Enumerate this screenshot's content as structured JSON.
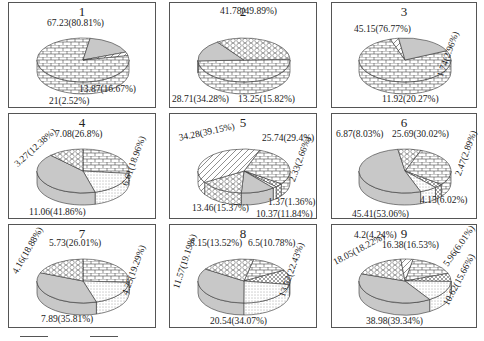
{
  "chart_data": [
    {
      "type": "pie",
      "title": "1",
      "slices": [
        {
          "value": 67.23,
          "percent": 80.81,
          "label": "67.23(80.81%)",
          "pattern": "brick"
        },
        {
          "value": 13.87,
          "percent": 16.67,
          "label": "13.87(16.67%)",
          "pattern": "gray"
        },
        {
          "value": 2.1,
          "percent": 2.52,
          "label": "21(2.52%)",
          "pattern": "diagonal"
        }
      ]
    },
    {
      "type": "pie",
      "title": "2",
      "slices": [
        {
          "value": 41.78,
          "percent": 49.89,
          "label": "41.78(49.89%)",
          "pattern": "brick"
        },
        {
          "value": 13.25,
          "percent": 15.82,
          "label": "13.25(15.82%)",
          "pattern": "gray"
        },
        {
          "value": 28.71,
          "percent": 34.28,
          "label": "28.71(34.28%)",
          "pattern": "hex"
        }
      ]
    },
    {
      "type": "pie",
      "title": "3",
      "slices": [
        {
          "value": 45.15,
          "percent": 76.77,
          "label": "45.15(76.77%)",
          "pattern": "brick"
        },
        {
          "value": 1.74,
          "percent": 2.96,
          "label": "1.74(2.96%)",
          "pattern": "diagonal"
        },
        {
          "value": 11.92,
          "percent": 20.27,
          "label": "11.92(20.27%)",
          "pattern": "gray"
        }
      ]
    },
    {
      "type": "pie",
      "title": "4",
      "slices": [
        {
          "value": 7.08,
          "percent": 26.8,
          "label": "7.08(26.8%)",
          "pattern": "brick"
        },
        {
          "value": 6.61,
          "percent": 18.96,
          "label": "6.61(18.96%)",
          "pattern": "dots"
        },
        {
          "value": 11.06,
          "percent": 41.86,
          "label": "11.06(41.86%)",
          "pattern": "gray"
        },
        {
          "value": 3.27,
          "percent": 12.38,
          "label": "3.27(12.38%)",
          "pattern": "hex"
        }
      ]
    },
    {
      "type": "pie",
      "title": "5",
      "slices": [
        {
          "value": 25.74,
          "percent": 29.4,
          "label": "25.74(29.4%)",
          "pattern": "brick"
        },
        {
          "value": 2.33,
          "percent": 2.66,
          "label": "2.33(2.66%)",
          "pattern": "crosshatch"
        },
        {
          "value": 1.37,
          "percent": 1.36,
          "label": "1.37(1.36%)",
          "pattern": "dots"
        },
        {
          "value": 10.37,
          "percent": 11.84,
          "label": "10.37(11.84%)",
          "pattern": "gray"
        },
        {
          "value": 13.46,
          "percent": 15.37,
          "label": "13.46(15.37%)",
          "pattern": "hex"
        },
        {
          "value": 34.28,
          "percent": 39.15,
          "label": "34.28(39.15%)",
          "pattern": "diagonal"
        }
      ]
    },
    {
      "type": "pie",
      "title": "6",
      "slices": [
        {
          "value": 25.69,
          "percent": 30.02,
          "label": "25.69(30.02%)",
          "pattern": "brick"
        },
        {
          "value": 2.47,
          "percent": 2.89,
          "label": "2.47(2.89%)",
          "pattern": "crosshatch"
        },
        {
          "value": 4.15,
          "percent": 6.02,
          "label": "4.15(6.02%)",
          "pattern": "dots"
        },
        {
          "value": 45.41,
          "percent": 53.06,
          "label": "45.41(53.06%)",
          "pattern": "gray"
        },
        {
          "value": 6.87,
          "percent": 8.03,
          "label": "6.87(8.03%)",
          "pattern": "hex"
        }
      ]
    },
    {
      "type": "pie",
      "title": "7",
      "slices": [
        {
          "value": 5.73,
          "percent": 26.01,
          "label": "5.73(26.01%)",
          "pattern": "brick"
        },
        {
          "value": 4.25,
          "percent": 19.29,
          "label": "4.25(19.29%)",
          "pattern": "dots"
        },
        {
          "value": 7.89,
          "percent": 35.81,
          "label": "7.89(35.81%)",
          "pattern": "gray"
        },
        {
          "value": 4.16,
          "percent": 18.88,
          "label": "4.16(18.88%)",
          "pattern": "hex"
        }
      ]
    },
    {
      "type": "pie",
      "title": "8",
      "slices": [
        {
          "value": 8.15,
          "percent": 13.52,
          "label": "8.15(13.52%)",
          "pattern": "brick"
        },
        {
          "value": 6.5,
          "percent": 10.78,
          "label": "6.5(10.78%)",
          "pattern": "crosshatch"
        },
        {
          "value": 13.52,
          "percent": 22.43,
          "label": "13.52(22.43%)",
          "pattern": "dots"
        },
        {
          "value": 20.54,
          "percent": 34.07,
          "label": "20.54(34.07%)",
          "pattern": "gray"
        },
        {
          "value": 11.57,
          "percent": 19.19,
          "label": "11.57(19.19%)",
          "pattern": "hex"
        }
      ]
    },
    {
      "type": "pie",
      "title": "9",
      "slices": [
        {
          "value": 16.38,
          "percent": 16.53,
          "label": "16.38(16.53%)",
          "pattern": "brick"
        },
        {
          "value": 5.96,
          "percent": 6.01,
          "label": "5.96(6.01%)",
          "pattern": "crosshatch"
        },
        {
          "value": 10.62,
          "percent": 15.66,
          "label": "10.62(15.66%)",
          "pattern": "dots"
        },
        {
          "value": 38.98,
          "percent": 39.34,
          "label": "38.98(39.34%)",
          "pattern": "gray"
        },
        {
          "value": 18.05,
          "percent": 18.22,
          "label": "18.05(18.22%)",
          "pattern": "hex"
        },
        {
          "value": 4.2,
          "percent": 4.24,
          "label": "4.2(4.24%)",
          "pattern": "diagonal"
        }
      ]
    }
  ],
  "colors": {
    "border": "#555555",
    "gray_fill": "#c8c8c8",
    "line": "#333333"
  }
}
